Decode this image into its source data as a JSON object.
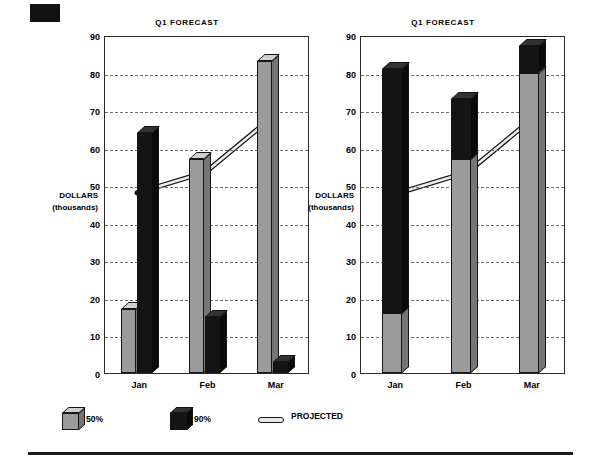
{
  "decorations": {
    "corner_mark": "black-block",
    "bottom_rule": "horizontal-rule"
  },
  "axis": {
    "y_label_line1": "DOLLARS",
    "y_label_line2": "(thousands)",
    "y_ticks": [
      0,
      10,
      20,
      30,
      40,
      50,
      60,
      70,
      80,
      90
    ],
    "x_ticks": [
      "Jan",
      "Feb",
      "Mar"
    ]
  },
  "legend": {
    "items": [
      {
        "label": "50%",
        "icon": "cube-gray",
        "color": "#9b9b9b"
      },
      {
        "label": "90%",
        "icon": "cube-black",
        "color": "#141414"
      },
      {
        "label": "PROJECTED",
        "icon": "line-swatch",
        "color": "#e8e8e8"
      }
    ]
  },
  "chart_data": [
    {
      "id": "left",
      "type": "bar",
      "title": "Q1 FORECAST",
      "grouping": "clustered",
      "categories": [
        "Jan",
        "Feb",
        "Mar"
      ],
      "xlabel": "",
      "ylabel": "DOLLARS (thousands)",
      "ylim": [
        0,
        90
      ],
      "ytick_step": 10,
      "grid": true,
      "grid_style": "dashed-horizontal",
      "legend_position": "below-figure",
      "series": [
        {
          "name": "50%",
          "color": "#9b9b9b",
          "values": [
            17,
            57,
            83
          ]
        },
        {
          "name": "90%",
          "color": "#141414",
          "values": [
            64,
            15,
            3
          ]
        },
        {
          "name": "PROJECTED",
          "color": "#e8e8e8",
          "type": "line",
          "values": [
            48.5,
            54,
            69
          ]
        }
      ]
    },
    {
      "id": "right",
      "type": "bar",
      "title": "Q1 FORECAST",
      "grouping": "stacked",
      "categories": [
        "Jan",
        "Feb",
        "Mar"
      ],
      "xlabel": "",
      "ylabel": "DOLLARS (thousands)",
      "ylim": [
        0,
        90
      ],
      "ytick_step": 10,
      "grid": true,
      "grid_style": "dashed-horizontal",
      "legend_position": "below-figure",
      "series": [
        {
          "name": "50%",
          "color": "#9b9b9b",
          "values": [
            16,
            57,
            80
          ]
        },
        {
          "name": "90%",
          "color": "#141414",
          "values": [
            65,
            16,
            7
          ]
        },
        {
          "name": "PROJECTED",
          "color": "#e8e8e8",
          "type": "line",
          "values": [
            48.5,
            54,
            69
          ]
        }
      ],
      "stack_totals": [
        81,
        73,
        87
      ]
    }
  ]
}
